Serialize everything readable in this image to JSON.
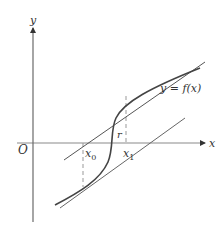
{
  "diagram": {
    "axes": {
      "x_label": "x",
      "y_label": "y",
      "origin_label": "O"
    },
    "labels": {
      "function": "y = f(x)",
      "root": "r",
      "x0_base": "x",
      "x0_sub": "0",
      "x1_base": "x",
      "x1_sub": "1"
    },
    "colors": {
      "axis": "#808080",
      "curve": "#444444",
      "tangent": "#555555",
      "dashed": "#999999",
      "text": "#333333"
    }
  }
}
